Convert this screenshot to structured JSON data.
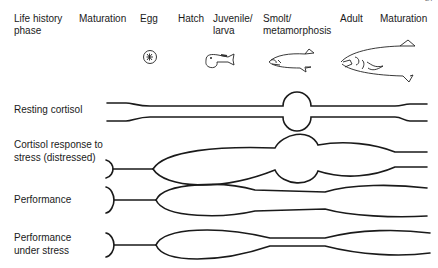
{
  "page_number": "27",
  "header": {
    "row_title": "Life history phase",
    "phases": [
      {
        "label": "Maturation"
      },
      {
        "label": "Egg"
      },
      {
        "label": "Hatch"
      },
      {
        "label": "Juvenile/ larva"
      },
      {
        "label": "Smolt/ metamorphosis"
      },
      {
        "label": "Adult"
      },
      {
        "label": "Maturation"
      }
    ]
  },
  "illustrations": [
    {
      "icon": "egg-icon",
      "phase": "Egg"
    },
    {
      "icon": "larva-fish-icon",
      "phase": "Juvenile/ larva"
    },
    {
      "icon": "smolt-fish-icon",
      "phase": "Smolt/ metamorphosis"
    },
    {
      "icon": "adult-fish-icon",
      "phase": "Adult"
    }
  ],
  "rows": [
    {
      "label": "Resting cortisol"
    },
    {
      "label": "Cortisol response to stress (distressed)"
    },
    {
      "label": "Performance"
    },
    {
      "label": "Performance under stress"
    }
  ]
}
